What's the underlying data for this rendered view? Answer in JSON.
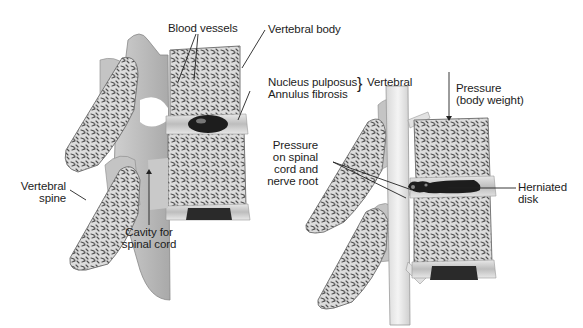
{
  "figure": {
    "colors": {
      "background": "#ffffff",
      "bone_fill": "#d9d9d9",
      "bone_texture": "#5a5a5a",
      "soft_tissue": "#bdbdbd",
      "nucleus": "#1e1e1e",
      "spinal_cord": "#ececec",
      "leader_line": "#222222"
    },
    "left_panel": {
      "name": "Normal spine segment",
      "labels": {
        "blood_vessels": "Blood vessels",
        "vertebral_body": "Vertebral body",
        "nucleus_pulposus": "Nucleus pulposus",
        "annulus_fibrosis": "Annulus fibrosis",
        "vertebral_group": "Vertebral",
        "vertebral_spine_1": "Vertebral",
        "vertebral_spine_2": "spine",
        "cavity_1": "Cavity for",
        "cavity_2": "spinal cord"
      },
      "signature": "Jung 'Ve Bach"
    },
    "right_panel": {
      "name": "Herniated disk segment",
      "labels": {
        "pressure_1": "Pressure",
        "pressure_2": "(body weight)",
        "pressure_cord_1": "Pressure",
        "pressure_cord_2": "on spinal",
        "pressure_cord_3": "cord and",
        "pressure_cord_4": "nerve root",
        "herniated_1": "Herniated",
        "herniated_2": "disk"
      }
    }
  }
}
